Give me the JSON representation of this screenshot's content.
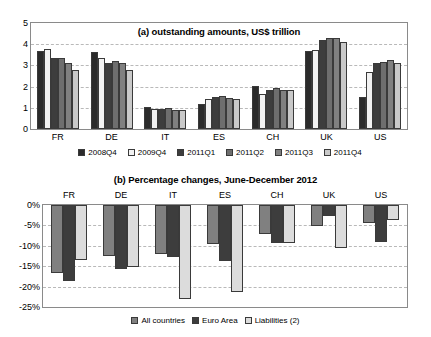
{
  "chart_data": [
    {
      "id": "panel-a",
      "type": "bar",
      "title": "(a) outstanding amounts, US$ trillion",
      "xlabel": "",
      "ylabel": "",
      "ylim": [
        0,
        5
      ],
      "yticks": [
        "0",
        "1",
        "2",
        "3",
        "4",
        "5"
      ],
      "grid": true,
      "legend_position": "bottom",
      "categories": [
        "FR",
        "DE",
        "IT",
        "ES",
        "CH",
        "UK",
        "US"
      ],
      "series": [
        {
          "name": "2008Q4",
          "color": "#2b2b2b",
          "values": [
            3.67,
            3.63,
            1.02,
            1.2,
            2.03,
            3.68,
            1.51
          ]
        },
        {
          "name": "2009Q4",
          "color": "#f2f2f2",
          "values": [
            3.78,
            3.33,
            0.95,
            1.42,
            1.66,
            3.75,
            2.67
          ]
        },
        {
          "name": "2011Q1",
          "color": "#3d3d3d",
          "values": [
            3.33,
            3.13,
            0.95,
            1.52,
            1.85,
            4.22,
            3.11
          ]
        },
        {
          "name": "2011Q2",
          "color": "#6e6e6e",
          "values": [
            3.36,
            3.2,
            0.97,
            1.58,
            1.93,
            4.28,
            3.18
          ]
        },
        {
          "name": "2011Q3",
          "color": "#808080",
          "values": [
            3.1,
            3.11,
            0.91,
            1.47,
            1.83,
            4.27,
            3.26
          ]
        },
        {
          "name": "2011Q4",
          "color": "#c9c9c9",
          "values": [
            2.79,
            2.8,
            0.88,
            1.43,
            1.82,
            4.1,
            3.1
          ]
        }
      ]
    },
    {
      "id": "panel-b",
      "type": "bar",
      "title": "(b) Percentage changes, June-December 2012",
      "xlabel": "",
      "ylabel": "",
      "ylim": [
        -25,
        0
      ],
      "yticks": [
        "0%",
        "-5%",
        "-10%",
        "-15%",
        "-20%",
        "-25%"
      ],
      "grid": true,
      "legend_position": "bottom",
      "categories": [
        "FR",
        "DE",
        "IT",
        "ES",
        "CH",
        "UK",
        "US"
      ],
      "series": [
        {
          "name": "All countries",
          "color": "#808080",
          "values": [
            -16.6,
            -12.4,
            -12.0,
            -9.5,
            -7.0,
            -5.2,
            -4.3
          ]
        },
        {
          "name": "Euro Area",
          "color": "#3d3d3d",
          "values": [
            -18.6,
            -15.7,
            -12.7,
            -13.7,
            -9.3,
            -2.7,
            -9.0
          ]
        },
        {
          "name": "Liabilities (2)",
          "color": "#dcdcdc",
          "values": [
            -13.4,
            -15.3,
            -23.0,
            -21.3,
            -9.2,
            -10.5,
            -3.7
          ]
        }
      ]
    }
  ]
}
